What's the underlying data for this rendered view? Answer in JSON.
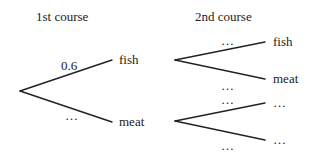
{
  "headings": {
    "first": "1st course",
    "second": "2nd course"
  },
  "first_course": {
    "outcomes": [
      {
        "label": "fish",
        "prob": "0.6"
      },
      {
        "label": "meat",
        "prob": "…"
      }
    ]
  },
  "second_course": {
    "after_fish": [
      {
        "label": "fish",
        "prob": "…"
      },
      {
        "label": "meat",
        "prob": "…"
      }
    ],
    "after_meat": [
      {
        "label": "…",
        "prob": "…"
      },
      {
        "label": "…",
        "prob": "…"
      }
    ]
  },
  "colors": {
    "ink": "#222222",
    "background": "#ffffff"
  }
}
